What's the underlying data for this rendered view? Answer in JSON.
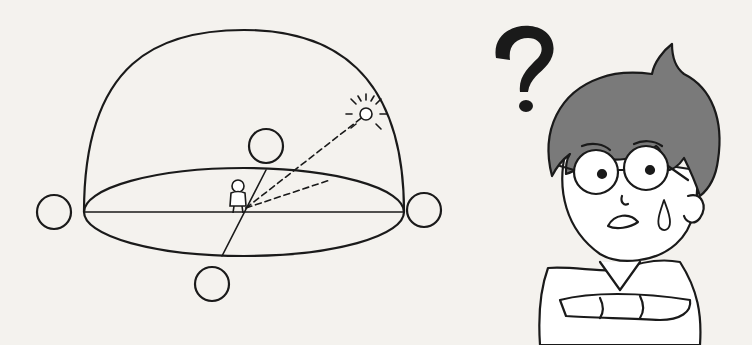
{
  "scene": {
    "description": "Line drawing of a celestial hemisphere with an observer at the center, sun on the dome, and a confused boy with a question mark",
    "colors": {
      "background": "#f4f2ee",
      "ink": "#1a1a1a",
      "hair": "#7a7a7a",
      "skin": "#ffffff"
    }
  },
  "celestial_dome": {
    "cardinal_markers": [
      "left-circle",
      "right-circle",
      "front-circle",
      "back-circle"
    ],
    "sun": "sun-icon",
    "observer": "person-figure",
    "sight_lines": "dashed"
  },
  "character": {
    "expression": "confused",
    "symbol": "?"
  }
}
